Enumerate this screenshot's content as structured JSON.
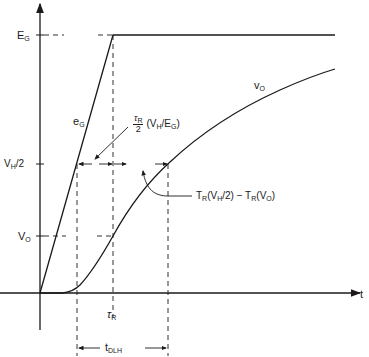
{
  "diagram": {
    "axes": {
      "x_label": "t"
    },
    "y_levels": {
      "eg": {
        "main": "E",
        "sub": "G"
      },
      "vh2": {
        "main": "V",
        "sub": "H",
        "rest": "/2"
      },
      "vo": {
        "main": "V",
        "sub": "O"
      }
    },
    "curves": {
      "input": {
        "main": "e",
        "sub": "G"
      },
      "output": {
        "main": "v",
        "sub": "O"
      }
    },
    "annotations": {
      "half_rise": {
        "num_main": "τ",
        "num_sub": "R",
        "den": "2",
        "rest_a": "(V",
        "rest_b": "H",
        "rest_c": "/E",
        "rest_d": "G",
        "rest_e": ")"
      },
      "delay_diff": {
        "a": "T",
        "b": "R",
        "c": "(V",
        "d": "H",
        "e": "/2) − T",
        "f": "R",
        "g": "(V",
        "h": "O",
        "i": ")"
      },
      "tau_r": {
        "main": "τ",
        "sub": "R"
      },
      "tdlh": {
        "main": "t",
        "sub": "DLH"
      }
    },
    "colors": {
      "ink": "#1a1a1a"
    }
  }
}
